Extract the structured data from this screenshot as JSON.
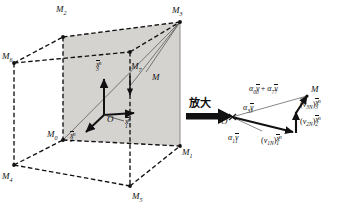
{
  "figure": {
    "annotation_cjk": "放大",
    "colors": {
      "ink": "#111111",
      "shaded_plane": "#d4d2cf",
      "thin_line": "#555555",
      "background": "#ffffff"
    }
  },
  "cube": {
    "vertices": [
      {
        "key": "M0",
        "label": "M",
        "sub": "0"
      },
      {
        "key": "M1",
        "label": "M",
        "sub": "1"
      },
      {
        "key": "M2",
        "label": "M",
        "sub": "2"
      },
      {
        "key": "M3",
        "label": "M",
        "sub": "3"
      },
      {
        "key": "M4",
        "label": "M",
        "sub": "4"
      },
      {
        "key": "M5",
        "label": "M",
        "sub": "5"
      },
      {
        "key": "M6",
        "label": "M",
        "sub": "6"
      },
      {
        "key": "M7",
        "label": "M",
        "sub": "7"
      }
    ],
    "interior_point": {
      "label": "M"
    },
    "origin": {
      "label": "O"
    },
    "axes": [
      {
        "key": "x1",
        "base": "x",
        "sub": "1",
        "sup": "n",
        "direction": "right"
      },
      {
        "key": "x2",
        "base": "x",
        "sub": "2",
        "sup": "n",
        "direction": "down-left"
      },
      {
        "key": "x3",
        "base": "x",
        "sub": "3",
        "sup": "n",
        "direction": "up"
      }
    ]
  },
  "magnified": {
    "origin": {
      "label": "O"
    },
    "point": {
      "label": "M"
    },
    "vectors": [
      {
        "key": "a1v1",
        "text": "α",
        "sub": "1",
        "vec": "v",
        "vsub": "1"
      },
      {
        "key": "a3v3",
        "text": "α",
        "sub": "3",
        "vec": "v",
        "vsub": "3"
      }
    ],
    "sum_label": {
      "a": "α",
      "asub": "0",
      "v": "v",
      "vsub": "0",
      "plus": "+",
      "b": "α",
      "bsub": "7",
      "w": "v",
      "wsub": "7"
    },
    "components": [
      {
        "key": "v1N",
        "v": "v",
        "vsub": "1N",
        "x": "x",
        "xsub": "1",
        "xsup": "n"
      },
      {
        "key": "v2N",
        "v": "v",
        "vsub": "2N",
        "x": "x",
        "xsub": "2",
        "xsup": "n"
      },
      {
        "key": "v3N",
        "v": "v",
        "vsub": "3N",
        "x": "x",
        "xsub": "3",
        "xsup": "n"
      }
    ]
  }
}
